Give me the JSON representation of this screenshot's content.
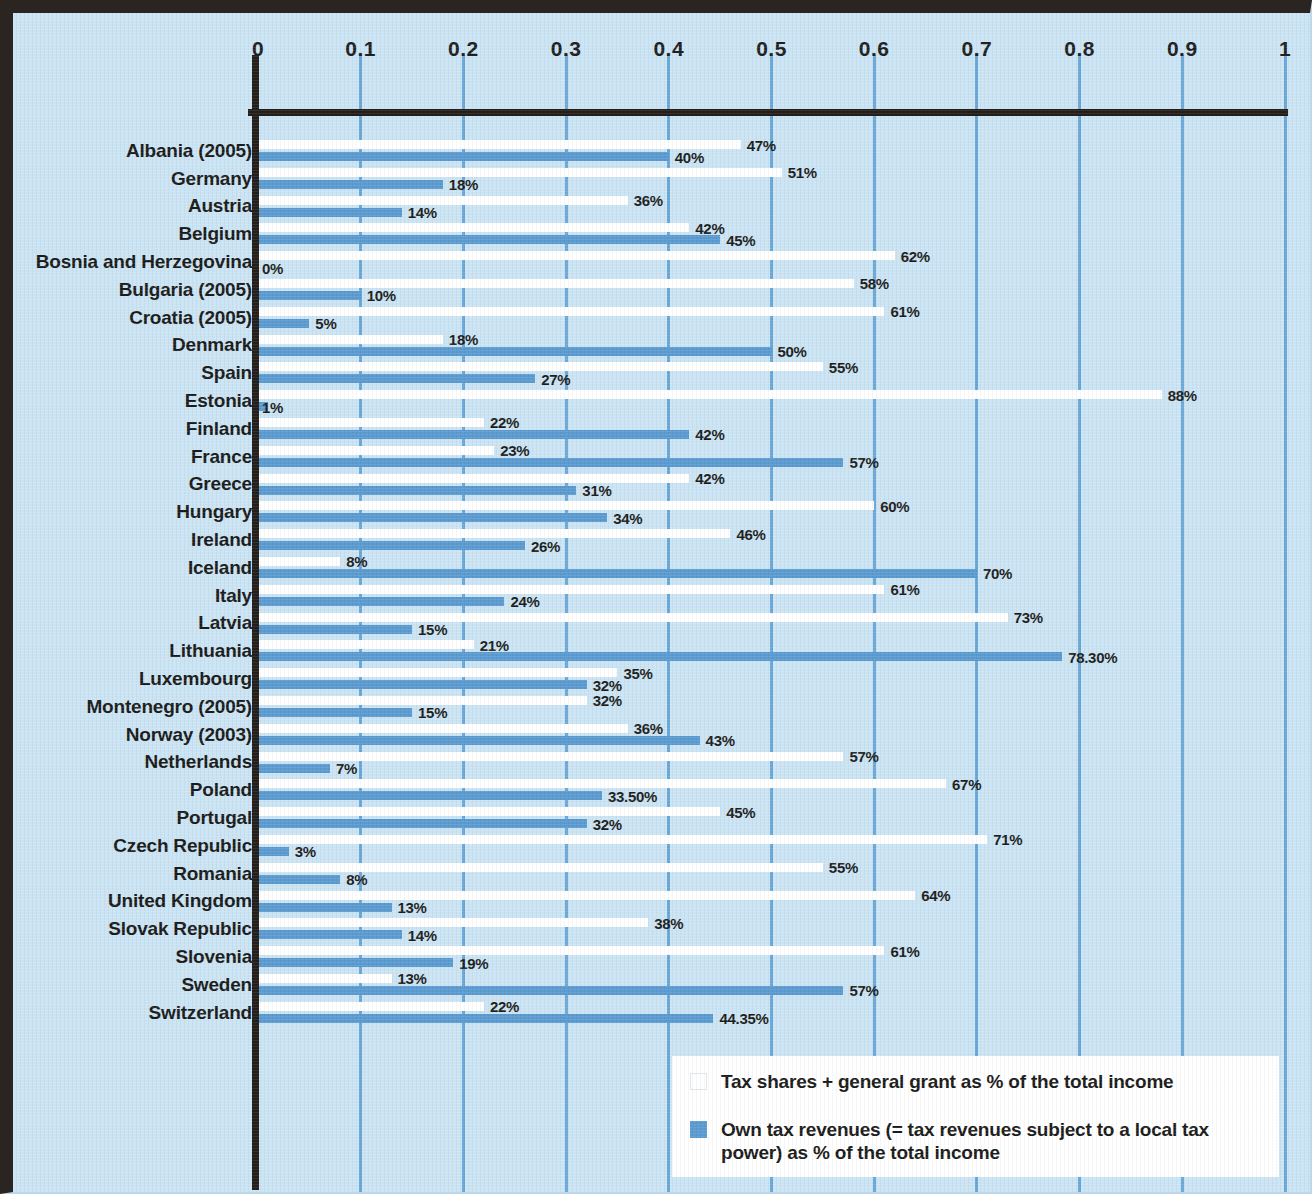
{
  "chart_data": {
    "type": "bar",
    "orientation": "horizontal",
    "title": "",
    "xlabel": "",
    "ylabel": "",
    "xlim": [
      0,
      1
    ],
    "grid": true,
    "legend_position": "bottom-right",
    "xticks": [
      "0",
      "0.1",
      "0.2",
      "0.3",
      "0.4",
      "0.5",
      "0.6",
      "0.7",
      "0.8",
      "0.9",
      "1"
    ],
    "xtick_values": [
      0,
      0.1,
      0.2,
      0.3,
      0.4,
      0.5,
      0.6,
      0.7,
      0.8,
      0.9,
      1
    ],
    "categories": [
      "Albania (2005)",
      "Germany",
      "Austria",
      "Belgium",
      "Bosnia and Herzegovina",
      "Bulgaria (2005)",
      "Croatia (2005)",
      "Denmark",
      "Spain",
      "Estonia",
      "Finland",
      "France",
      "Greece",
      "Hungary",
      "Ireland",
      "Iceland",
      "Italy",
      "Latvia",
      "Lithuania",
      "Luxembourg",
      "Montenegro (2005)",
      "Norway (2003)",
      "Netherlands",
      "Poland",
      "Portugal",
      "Czech Republic",
      "Romania",
      "United Kingdom",
      "Slovak Republic",
      "Slovenia",
      "Sweden",
      "Switzerland"
    ],
    "series": [
      {
        "name": "Tax shares + general grant as % of the total income",
        "color": "#ffffff",
        "values": [
          0.47,
          0.51,
          0.36,
          0.42,
          0.62,
          0.58,
          0.61,
          0.18,
          0.55,
          0.88,
          0.22,
          0.23,
          0.42,
          0.6,
          0.46,
          0.08,
          0.61,
          0.73,
          0.21,
          0.35,
          0.32,
          0.36,
          0.57,
          0.67,
          0.45,
          0.71,
          0.55,
          0.64,
          0.38,
          0.61,
          0.13,
          0.22
        ],
        "labels": [
          "47%",
          "51%",
          "36%",
          "42%",
          "62%",
          "58%",
          "61%",
          "18%",
          "55%",
          "88%",
          "22%",
          "23%",
          "42%",
          "60%",
          "46%",
          "8%",
          "61%",
          "73%",
          "21%",
          "35%",
          "32%",
          "36%",
          "57%",
          "67%",
          "45%",
          "71%",
          "55%",
          "64%",
          "38%",
          "61%",
          "13%",
          "22%"
        ]
      },
      {
        "name": "Own tax revenues (= tax revenues subject to a local tax power) as % of the total income",
        "color": "#5b9bd0",
        "values": [
          0.4,
          0.18,
          0.14,
          0.45,
          0.0,
          0.1,
          0.05,
          0.5,
          0.27,
          0.01,
          0.42,
          0.57,
          0.31,
          0.34,
          0.26,
          0.7,
          0.24,
          0.15,
          0.783,
          0.32,
          0.15,
          0.43,
          0.07,
          0.335,
          0.32,
          0.03,
          0.08,
          0.13,
          0.14,
          0.19,
          0.57,
          0.4435
        ],
        "labels": [
          "40%",
          "18%",
          "14%",
          "45%",
          "0%",
          "10%",
          "5%",
          "50%",
          "27%",
          "1%",
          "42%",
          "57%",
          "31%",
          "34%",
          "26%",
          "70%",
          "24%",
          "15%",
          "78.30%",
          "32%",
          "15%",
          "43%",
          "7%",
          "33.50%",
          "32%",
          "3%",
          "8%",
          "13%",
          "14%",
          "19%",
          "57%",
          "44.35%"
        ]
      }
    ]
  },
  "legend": {
    "items": [
      {
        "swatch": "white",
        "label": "Tax shares + general grant as % of the total income"
      },
      {
        "swatch": "blue",
        "label": "Own tax revenues (= tax revenues subject to a local tax power) as % of the total income"
      }
    ]
  },
  "colors": {
    "background": "#cbe4f4",
    "grid": "#6aa8d8",
    "axis": "#241f1b",
    "series_white": "#ffffff",
    "series_blue": "#5b9bd0",
    "text": "#1b1b1a"
  }
}
